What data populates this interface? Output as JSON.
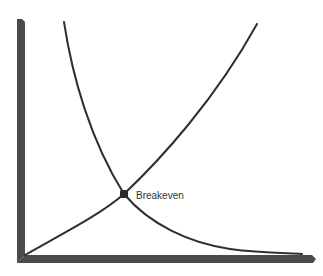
{
  "diagram": {
    "type": "breakeven-curves",
    "colors": {
      "axis": "#4a4a4a",
      "curve": "#2f2f2f",
      "marker": "#2a2a2a",
      "label": "#333333",
      "background": "#ffffff"
    },
    "axes": {
      "x_label": "",
      "y_label": "",
      "ticks": false
    },
    "curves": [
      {
        "name": "decreasing-curve",
        "description": "Curve falling from top-left to bottom-right"
      },
      {
        "name": "increasing-curve",
        "description": "Curve rising from origin to top-right"
      }
    ],
    "intersection": {
      "label": "Breakeven"
    }
  }
}
